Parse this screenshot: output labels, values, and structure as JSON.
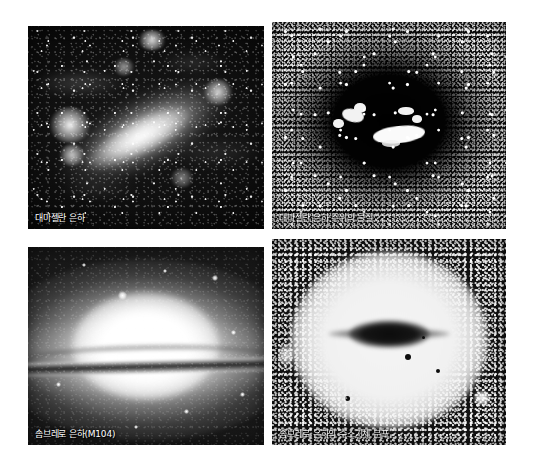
{
  "figure": {
    "layout": "2x2-grid",
    "background_color": "#ffffff",
    "caption_color": "#ffffff",
    "panels": [
      {
        "id": "lmc-optical",
        "caption": "대마젤란 은하",
        "kind": "photograph",
        "rendering": "positive-grayscale",
        "subject": "Large Magellanic Cloud optical image"
      },
      {
        "id": "lmc-hydrogen",
        "caption": "대마젤란 은하 주위의 물질",
        "kind": "photograph",
        "rendering": "negative-grayscale",
        "subject": "Material surrounding the Large Magellanic Cloud"
      },
      {
        "id": "m104-optical",
        "caption": "솜브레로 은하(M104)",
        "kind": "photograph",
        "rendering": "positive-grayscale",
        "subject": "Sombrero Galaxy M104 optical image"
      },
      {
        "id": "m104-hydrogen",
        "caption": "솜브레로 은하의 수소기체 분포",
        "kind": "photograph",
        "rendering": "negative-grayscale",
        "subject": "Hydrogen gas distribution of the Sombrero Galaxy"
      }
    ]
  }
}
